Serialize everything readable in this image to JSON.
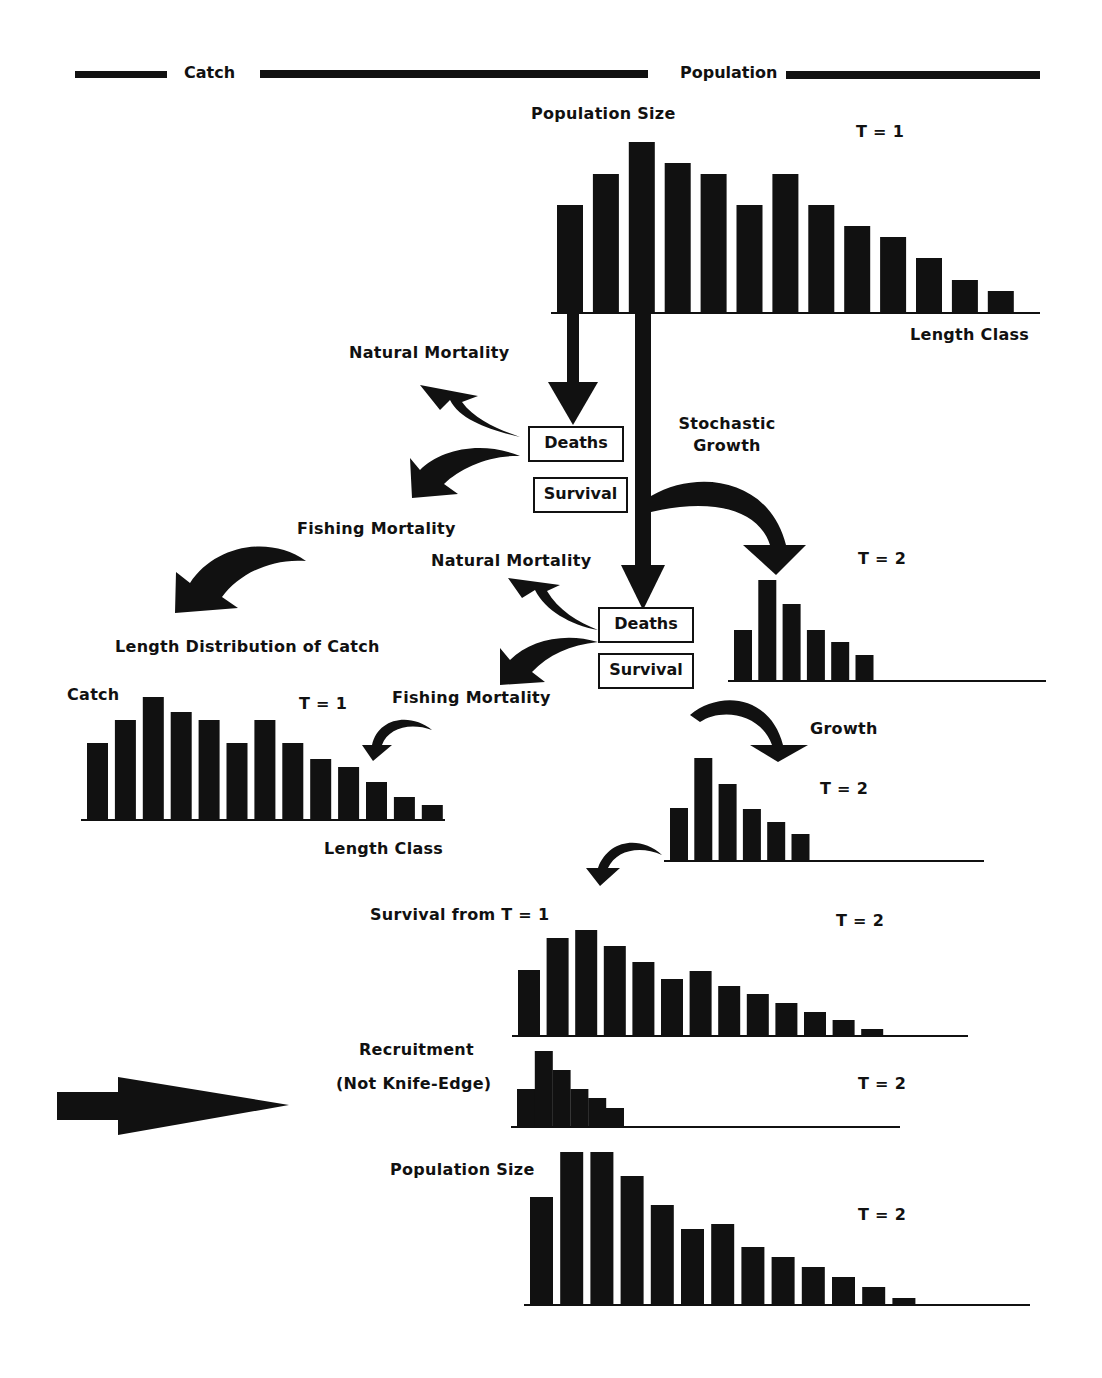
{
  "header": {
    "catch_label": "Catch",
    "population_label": "Population"
  },
  "labels": {
    "population_size_t1": "Population Size",
    "t1_top": "T = 1",
    "length_class_top": "Length Class",
    "natural_mortality_1": "Natural Mortality",
    "stochastic_growth": "Stochastic\nGrowth",
    "fishing_mortality_1": "Fishing Mortality",
    "natural_mortality_2": "Natural Mortality",
    "t2_a": "T = 2",
    "length_distribution_of_catch": "Length Distribution of Catch",
    "catch_ylabel": "Catch",
    "t1_catch": "T = 1",
    "fishing_mortality_2": "Fishing Mortality",
    "growth": "Growth",
    "t2_b": "T = 2",
    "length_class_catch": "Length Class",
    "survival_from_t1": "Survival from T = 1",
    "t2_c": "T = 2",
    "recruitment": "Recruitment",
    "not_knife_edge": "(Not Knife-Edge)",
    "t2_d": "T = 2",
    "population_size_t2": "Population Size",
    "t2_e": "T = 2"
  },
  "boxes": {
    "deaths_1": "Deaths",
    "survival_1": "Survival",
    "deaths_2": "Deaths",
    "survival_2": "Survival"
  },
  "colors": {
    "ink": "#111111",
    "paper": "#ffffff"
  },
  "chart_data": [
    {
      "type": "bar",
      "title": "Population Size T = 1",
      "xlabel": "Length Class",
      "ylabel": "Population Size",
      "categories": [
        "1",
        "2",
        "3",
        "4",
        "5",
        "6",
        "7",
        "8",
        "9",
        "10",
        "11",
        "12",
        "13"
      ],
      "values": [
        107,
        138,
        170,
        149,
        138,
        107,
        138,
        107,
        86,
        75,
        54,
        32,
        21
      ],
      "ylim": [
        0,
        175
      ]
    },
    {
      "type": "bar",
      "title": "Stochastic Growth T = 2",
      "categories": [
        "1",
        "2",
        "3",
        "4",
        "5",
        "6"
      ],
      "values": [
        50,
        100,
        76,
        50,
        38,
        25
      ],
      "ylim": [
        0,
        105
      ]
    },
    {
      "type": "bar",
      "title": "Length Distribution of Catch T = 1",
      "xlabel": "Length Class",
      "ylabel": "Catch",
      "categories": [
        "1",
        "2",
        "3",
        "4",
        "5",
        "6",
        "7",
        "8",
        "9",
        "10",
        "11",
        "12",
        "13"
      ],
      "values": [
        76,
        99,
        122,
        107,
        99,
        76,
        99,
        76,
        60,
        52,
        37,
        22,
        14
      ],
      "ylim": [
        0,
        125
      ]
    },
    {
      "type": "bar",
      "title": "Growth T = 2",
      "categories": [
        "1",
        "2",
        "3",
        "4",
        "5",
        "6"
      ],
      "values": [
        52,
        102,
        76,
        51,
        38,
        26
      ],
      "ylim": [
        0,
        105
      ]
    },
    {
      "type": "bar",
      "title": "Survival from T = 1 (T = 2)",
      "categories": [
        "1",
        "2",
        "3",
        "4",
        "5",
        "6",
        "7",
        "8",
        "9",
        "10",
        "11",
        "12",
        "13"
      ],
      "values": [
        65,
        97,
        105,
        89,
        73,
        56,
        64,
        49,
        41,
        32,
        23,
        15,
        6
      ],
      "ylim": [
        0,
        110
      ]
    },
    {
      "type": "bar",
      "title": "Recruitment (Not Knife-Edge) T = 2",
      "categories": [
        "1",
        "2",
        "3",
        "4",
        "5",
        "6"
      ],
      "values": [
        37,
        75,
        56,
        37,
        28,
        18
      ],
      "ylim": [
        0,
        80
      ]
    },
    {
      "type": "bar",
      "title": "Population Size T = 2",
      "categories": [
        "1",
        "2",
        "3",
        "4",
        "5",
        "6",
        "7",
        "8",
        "9",
        "10",
        "11",
        "12",
        "13"
      ],
      "values": [
        107,
        152,
        152,
        128,
        99,
        75,
        80,
        57,
        47,
        37,
        27,
        17,
        6
      ],
      "ylim": [
        0,
        155
      ]
    }
  ]
}
